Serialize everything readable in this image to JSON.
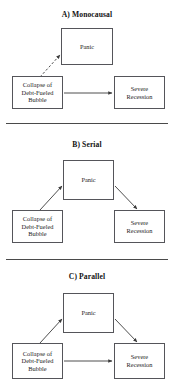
{
  "figure": {
    "width": 174,
    "height": 392,
    "background": "#ffffff",
    "line_color": "#55555a",
    "text_color": "#1d1d1d",
    "divider_color": "#4a4a4a"
  },
  "labels": {
    "panic": "Panic",
    "collapse": "Collapse of\nDebt-Fueled\nBubble",
    "severe": "Severe\nRecession"
  },
  "panels": [
    {
      "id": "monocausal",
      "title": "A) Monocausal",
      "title_y": 10,
      "nodes": [
        {
          "key": "panic",
          "name": "node-panic",
          "label": "Panic",
          "x": 61,
          "y": 28,
          "w": 52,
          "h": 37
        },
        {
          "key": "collapse",
          "name": "node-collapse",
          "label": "Collapse of\nDebt-Fueled\nBubble",
          "x": 12,
          "y": 76,
          "w": 51,
          "h": 33
        },
        {
          "key": "severe",
          "name": "node-severe",
          "label": "Severe\nRecession",
          "x": 114,
          "y": 76,
          "w": 51,
          "h": 33
        }
      ],
      "edges": [
        {
          "name": "edge-collapse-to-panic",
          "style": "dashed",
          "x1": 40,
          "y1": 77,
          "x2": 60,
          "y2": 55
        },
        {
          "name": "edge-collapse-to-severe",
          "style": "solid",
          "x1": 64,
          "y1": 93,
          "x2": 112,
          "y2": 93
        }
      ]
    },
    {
      "id": "serial",
      "title": "B) Serial",
      "title_y": 140,
      "nodes": [
        {
          "key": "panic",
          "name": "node-panic",
          "label": "Panic",
          "x": 63,
          "y": 160,
          "w": 51,
          "h": 40
        },
        {
          "key": "collapse",
          "name": "node-collapse",
          "label": "Collapse of\nDebt-Fueled\nBubble",
          "x": 12,
          "y": 210,
          "w": 51,
          "h": 33
        },
        {
          "key": "severe",
          "name": "node-severe",
          "label": "Severe\nRecession",
          "x": 114,
          "y": 210,
          "w": 51,
          "h": 33
        }
      ],
      "edges": [
        {
          "name": "edge-collapse-to-panic",
          "style": "solid",
          "x1": 40,
          "y1": 210,
          "x2": 62,
          "y2": 186
        },
        {
          "name": "edge-panic-to-severe",
          "style": "solid",
          "x1": 115,
          "y1": 186,
          "x2": 137,
          "y2": 209
        }
      ]
    },
    {
      "id": "parallel",
      "title": "C) Parallel",
      "title_y": 272,
      "nodes": [
        {
          "key": "panic",
          "name": "node-panic",
          "label": "Panic",
          "x": 63,
          "y": 293,
          "w": 51,
          "h": 40
        },
        {
          "key": "collapse",
          "name": "node-collapse",
          "label": "Collapse of\nDebt-Fueled\nBubble",
          "x": 12,
          "y": 343,
          "w": 51,
          "h": 36
        },
        {
          "key": "severe",
          "name": "node-severe",
          "label": "Severe\nRecession",
          "x": 114,
          "y": 343,
          "w": 51,
          "h": 36
        }
      ],
      "edges": [
        {
          "name": "edge-collapse-to-panic",
          "style": "solid",
          "x1": 40,
          "y1": 343,
          "x2": 62,
          "y2": 319
        },
        {
          "name": "edge-panic-to-severe",
          "style": "solid",
          "x1": 115,
          "y1": 319,
          "x2": 137,
          "y2": 342
        },
        {
          "name": "edge-collapse-to-severe",
          "style": "solid",
          "x1": 64,
          "y1": 361,
          "x2": 112,
          "y2": 361
        }
      ]
    }
  ],
  "dividers": [
    {
      "name": "divider-a-b",
      "y": 123
    },
    {
      "name": "divider-b-c",
      "y": 259
    }
  ]
}
